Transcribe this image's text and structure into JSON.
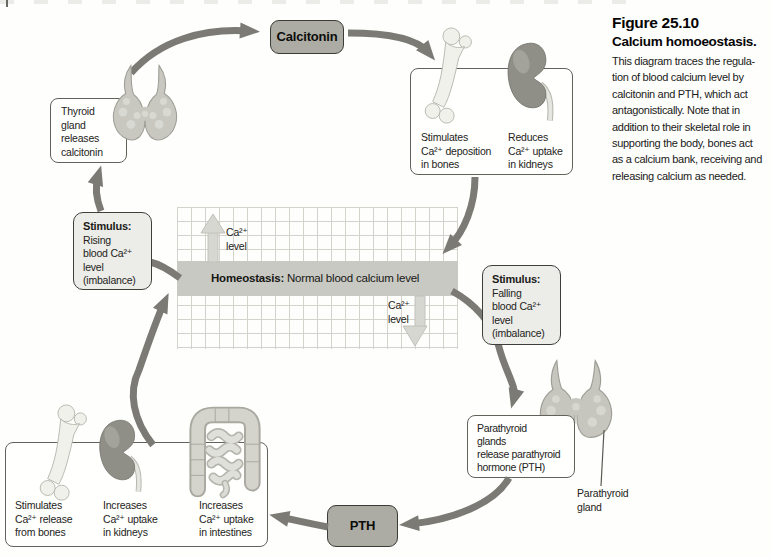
{
  "figure": {
    "label": "Figure 25.10",
    "title": "Calcium homoeostasis.",
    "caption": "This diagram traces the regula-\ntion of blood calcium level by\ncalcitonin and PTH, which act\nantagonistically. Note that in\naddition to their skeletal role in\nsupporting the body, bones act\nas a calcium bank, receiving and\nreleasing calcium as needed."
  },
  "hormones": {
    "calcitonin": "Calcitonin",
    "pth": "PTH"
  },
  "labels": {
    "thyroid": "Thyroid\ngland\nreleases\ncalcitonin",
    "calcitonin_effect_bones": "Stimulates\nCa²⁺ deposition\nin bones",
    "calcitonin_effect_kidneys": "Reduces\nCa²⁺ uptake\nin kidneys",
    "parathyroid": "Parathyroid\nglands\nrelease parathyroid\nhormone (PTH)",
    "parathyroid_gland": "Parathyroid\ngland",
    "pth_effect_bones": "Stimulates\nCa²⁺ release\nfrom bones",
    "pth_effect_kidneys": "Increases\nCa²⁺ uptake\nin kidneys",
    "pth_effect_intestines": "Increases\nCa²⁺ uptake\nin intestines"
  },
  "stimulus_rising": {
    "heading": "Stimulus:",
    "body": "Rising\nblood Ca²⁺\nlevel\n(imbalance)"
  },
  "stimulus_falling": {
    "heading": "Stimulus:",
    "body": "Falling\nblood Ca²⁺\nlevel\n(imbalance)"
  },
  "homeostasis": {
    "label": "Homeostasis:",
    "text": " Normal blood calcium level"
  },
  "axis": {
    "ca_up": "Ca²⁺\nlevel",
    "ca_down": "Ca²⁺\nlevel"
  },
  "colors": {
    "dark_arrow": "#7b7a74",
    "light_arrow": "#d7d7d1",
    "homeostasis_band": "#c9c9c3",
    "grid_line": "#d3d3cc",
    "hormone_box_fill": "#acaca5",
    "stimulus_box_fill": "#ececE8"
  }
}
